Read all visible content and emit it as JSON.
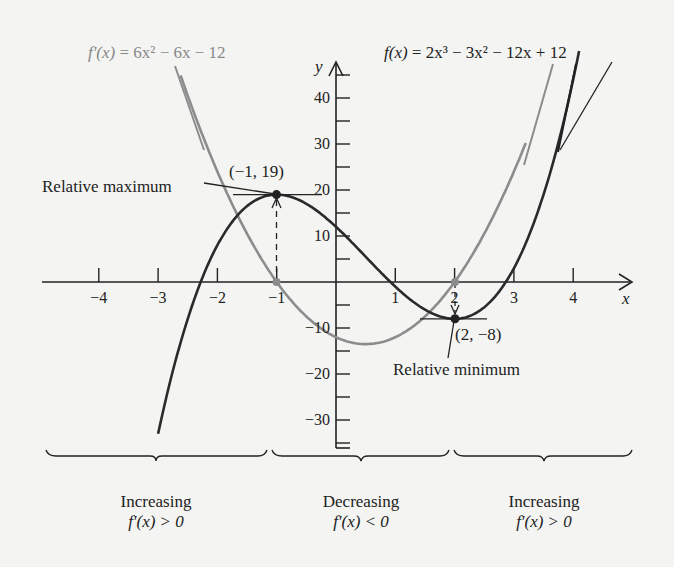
{
  "chart_data": {
    "type": "line",
    "title": "",
    "xlabel": "x",
    "ylabel": "y",
    "xlim": [
      -4.5,
      4.9
    ],
    "ylim": [
      -40,
      48
    ],
    "grid": false,
    "x_ticks": [
      -4,
      -3,
      -2,
      -1,
      1,
      2,
      3,
      4
    ],
    "x_tick_labels": [
      "−4",
      "−3",
      "−2",
      "−1",
      "1",
      "2",
      "3",
      "4"
    ],
    "y_ticks": [
      -30,
      -20,
      -10,
      10,
      20,
      30,
      40
    ],
    "y_tick_labels": [
      "−30",
      "−20",
      "−10",
      "10",
      "20",
      "30",
      "40"
    ],
    "series": [
      {
        "name": "f(x) = 2x³ − 3x² − 12x + 12",
        "color": "#2a2a2a",
        "formula": "2x^3 - 3x^2 - 12x + 12",
        "x_range": [
          -3.0,
          4.1
        ],
        "x": [
          -3,
          -2.5,
          -2,
          -1.5,
          -1,
          -0.5,
          0,
          0.5,
          1,
          1.5,
          2,
          2.5,
          3,
          3.5,
          4
        ],
        "values": [
          -33,
          -8,
          8,
          16.5,
          19,
          16.5,
          12,
          5.5,
          -1,
          -6,
          -8,
          -5,
          3,
          17.5,
          44
        ]
      },
      {
        "name": "f'(x) = 6x² − 6x − 12",
        "color": "#8c8c8c",
        "formula": "6x^2 - 6x - 12",
        "x_range": [
          -2.62,
          3.2
        ],
        "x": [
          -2.5,
          -2,
          -1.5,
          -1,
          -0.5,
          0,
          0.5,
          1,
          1.5,
          2,
          2.5,
          3
        ],
        "values": [
          40.5,
          24,
          10.5,
          0,
          -7.5,
          -12,
          -13.5,
          -12,
          -7.5,
          0,
          10.5,
          24
        ]
      }
    ],
    "points": [
      {
        "x": -1,
        "y": 19,
        "label": "(−1, 19)",
        "annotation": "Relative maximum"
      },
      {
        "x": 2,
        "y": -8,
        "label": "(2, −8)",
        "annotation": "Relative minimum"
      },
      {
        "x": -1,
        "y": 0
      },
      {
        "x": 2,
        "y": 0
      }
    ],
    "intervals": [
      {
        "range": "x < −1",
        "label": "Increasing",
        "condition": "f'(x) > 0"
      },
      {
        "range": "−1 < x < 2",
        "label": "Decreasing",
        "condition": "f'(x) < 0"
      },
      {
        "range": "x > 2",
        "label": "Increasing",
        "condition": "f'(x) > 0"
      }
    ]
  },
  "labels": {
    "fprime_eq": {
      "lhs": "f'(x)",
      "rhs": " = 6x² − 6x − 12"
    },
    "f_eq": {
      "lhs": "f(x)",
      "rhs": " = 2x³ − 3x² − 12x + 12"
    },
    "max_label": "Relative maximum",
    "max_point": "(−1, 19)",
    "min_point": "(2, −8)",
    "min_label": "Relative minimum",
    "x_axis": "x",
    "y_axis": "y"
  },
  "regions": [
    {
      "title": "Increasing",
      "cond": "f'(x) > 0"
    },
    {
      "title": "Decreasing",
      "cond": "f'(x) < 0"
    },
    {
      "title": "Increasing",
      "cond": "f'(x) > 0"
    }
  ],
  "colors": {
    "f": "#2a2a2a",
    "fprime": "#8c8c8c",
    "axis": "#222222",
    "background": "#f4f4f2"
  }
}
